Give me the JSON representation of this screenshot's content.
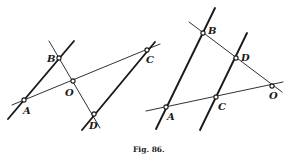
{
  "caption": "Fig. 86.",
  "figures": [
    {
      "name": "left",
      "points": {
        "A": {
          "label": "A",
          "x": 24,
          "y": 100
        },
        "B": {
          "label": "B",
          "x": 59,
          "y": 58
        },
        "O": {
          "label": "O",
          "x": 73,
          "y": 81
        },
        "C": {
          "label": "C",
          "x": 147,
          "y": 50
        },
        "D": {
          "label": "D",
          "x": 94,
          "y": 114
        }
      }
    },
    {
      "name": "right",
      "points": {
        "A": {
          "label": "A",
          "x": 166,
          "y": 107
        },
        "B": {
          "label": "B",
          "x": 203,
          "y": 33
        },
        "C": {
          "label": "C",
          "x": 216,
          "y": 97
        },
        "D": {
          "label": "D",
          "x": 236,
          "y": 58
        },
        "O": {
          "label": "O",
          "x": 272,
          "y": 86
        }
      }
    }
  ]
}
